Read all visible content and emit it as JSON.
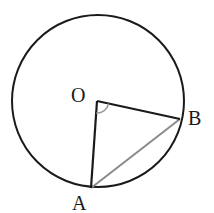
{
  "diagram": {
    "type": "circle-geometry",
    "points": {
      "O": {
        "label": "O",
        "role": "center"
      },
      "A": {
        "label": "A",
        "role": "point on circle"
      },
      "B": {
        "label": "B",
        "role": "point on circle"
      }
    },
    "segments": [
      {
        "name": "OA",
        "kind": "radius"
      },
      {
        "name": "OB",
        "kind": "radius"
      },
      {
        "name": "AB",
        "kind": "chord"
      }
    ],
    "angle_marks": [
      {
        "name": "AOB",
        "vertex": "O"
      }
    ],
    "colors": {
      "stroke": "#1a1a1a",
      "chord": "#8a8a8a",
      "angle_arc": "#9a9a9a"
    }
  }
}
